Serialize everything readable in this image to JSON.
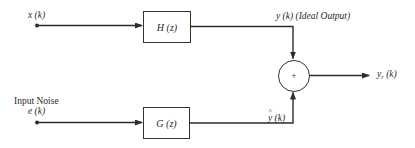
{
  "diagram": {
    "type": "block-diagram",
    "inputs": {
      "signal": {
        "label": "x (k)"
      },
      "noise": {
        "title": "Input Noise",
        "label": "e (k)"
      }
    },
    "blocks": {
      "ideal": {
        "label": "H (z)"
      },
      "noise": {
        "label": "G (z)"
      }
    },
    "signals": {
      "ideal_output": {
        "label": "y (k) (Ideal Output)"
      },
      "noise_output": {
        "var": "y",
        "arg": " (k)"
      },
      "real_output": {
        "var": "y",
        "sub": "r",
        "arg": " (k)"
      }
    },
    "summing_junction": {
      "symbol": "+"
    },
    "colors": {
      "line": "#2b2b2b",
      "text": "#2a2a2a",
      "background": "#ffffff"
    }
  }
}
